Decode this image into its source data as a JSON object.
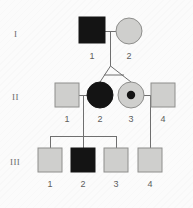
{
  "diagram": {
    "type": "pedigree",
    "background_color": "#fbfbfb",
    "line_color": "#6f6f6f",
    "affected_color": "#141414",
    "unaffected_color": "#cfcfcd",
    "unaffected_stroke": "#8e8e8c",
    "generation_labels": [
      {
        "text": "I",
        "x": 14,
        "y": 37
      },
      {
        "text": "II",
        "x": 13,
        "y": 100
      },
      {
        "text": "III",
        "x": 11,
        "y": 165
      }
    ],
    "generations": [
      {
        "roman": "I",
        "individuals": [
          {
            "id": "I-1",
            "label": "1",
            "sex": "male",
            "shape": "square",
            "status": "affected",
            "cx": 92,
            "cy": 30,
            "size": 26,
            "label_x": 92,
            "label_y": 56
          },
          {
            "id": "I-2",
            "label": "2",
            "sex": "female",
            "shape": "circle",
            "status": "unaffected",
            "cx": 129,
            "cy": 31,
            "r": 13,
            "label_x": 129,
            "label_y": 56
          }
        ]
      },
      {
        "roman": "II",
        "individuals": [
          {
            "id": "II-1",
            "label": "1",
            "sex": "male",
            "shape": "square",
            "status": "unaffected",
            "cx": 67,
            "cy": 95,
            "size": 24,
            "label_x": 67,
            "label_y": 119
          },
          {
            "id": "II-2",
            "label": "2",
            "sex": "female",
            "shape": "circle",
            "status": "affected",
            "cx": 100,
            "cy": 95,
            "r": 13,
            "label_x": 100,
            "label_y": 119
          },
          {
            "id": "II-3",
            "label": "3",
            "sex": "female",
            "shape": "circle",
            "status": "carrier",
            "cx": 131,
            "cy": 95,
            "r": 13,
            "dot_r": 4,
            "label_x": 131,
            "label_y": 119
          },
          {
            "id": "II-4",
            "label": "4",
            "sex": "male",
            "shape": "square",
            "status": "unaffected",
            "cx": 163,
            "cy": 95,
            "size": 24,
            "label_x": 163,
            "label_y": 119
          }
        ]
      },
      {
        "roman": "III",
        "individuals": [
          {
            "id": "III-1",
            "label": "1",
            "sex": "male",
            "shape": "square",
            "status": "unaffected",
            "cx": 50,
            "cy": 160,
            "size": 24,
            "label_x": 50,
            "label_y": 184
          },
          {
            "id": "III-2",
            "label": "2",
            "sex": "male",
            "shape": "square",
            "status": "affected",
            "cx": 83,
            "cy": 160,
            "size": 24,
            "label_x": 83,
            "label_y": 184
          },
          {
            "id": "III-3",
            "label": "3",
            "sex": "male",
            "shape": "square",
            "status": "unaffected",
            "cx": 116,
            "cy": 160,
            "size": 24,
            "label_x": 116,
            "label_y": 184
          },
          {
            "id": "III-4",
            "label": "4",
            "sex": "male",
            "shape": "square",
            "status": "unaffected",
            "cx": 150,
            "cy": 160,
            "size": 24,
            "label_x": 150,
            "label_y": 184
          }
        ]
      }
    ],
    "matings": [
      {
        "name": "mating-I1-I2",
        "x1": 105,
        "y1": 31,
        "x2": 116,
        "y2": 31
      },
      {
        "name": "mating-II1-II2",
        "x1": 79,
        "y1": 95,
        "x2": 87,
        "y2": 95
      },
      {
        "name": "mating-II3-II4",
        "x1": 144,
        "y1": 95,
        "x2": 151,
        "y2": 95
      }
    ],
    "descent_lines": [
      {
        "name": "descent-I-to-twins",
        "x1": 110,
        "y1": 31,
        "x2": 110,
        "y2": 66
      },
      {
        "name": "twin-left-leg",
        "x1": 110,
        "y1": 66,
        "x2": 100,
        "y2": 82
      },
      {
        "name": "twin-right-leg",
        "x1": 110,
        "y1": 66,
        "x2": 131,
        "y2": 82
      },
      {
        "name": "twin-crossbar",
        "x1": 104,
        "y1": 75,
        "x2": 124,
        "y2": 75
      },
      {
        "name": "sibship-drop-II1-II2",
        "x1": 83,
        "y1": 95,
        "x2": 83,
        "y2": 136
      },
      {
        "name": "sibship-bar-III",
        "x1": 50,
        "y1": 136,
        "x2": 116,
        "y2": 136
      },
      {
        "name": "sib-stem-III1",
        "x1": 50,
        "y1": 136,
        "x2": 50,
        "y2": 148
      },
      {
        "name": "sib-stem-III2",
        "x1": 83,
        "y1": 136,
        "x2": 83,
        "y2": 148
      },
      {
        "name": "sib-stem-III3",
        "x1": 116,
        "y1": 136,
        "x2": 116,
        "y2": 148
      },
      {
        "name": "descent-II3-II4-to-III4",
        "x1": 150,
        "y1": 95,
        "x2": 150,
        "y2": 148
      }
    ]
  }
}
